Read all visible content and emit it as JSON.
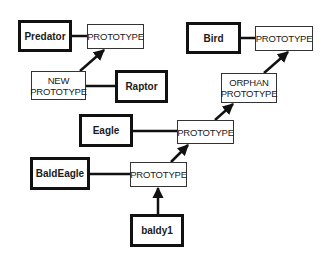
{
  "diagram": {
    "objects": [
      {
        "id": "predator",
        "label": "Predator",
        "x": 18,
        "y": 20,
        "w": 54,
        "h": 32
      },
      {
        "id": "raptor",
        "label": "Raptor",
        "x": 115,
        "y": 70,
        "w": 53,
        "h": 33
      },
      {
        "id": "bird",
        "label": "Bird",
        "x": 186,
        "y": 22,
        "w": 55,
        "h": 32
      },
      {
        "id": "eagle",
        "label": "Eagle",
        "x": 79,
        "y": 114,
        "w": 54,
        "h": 33
      },
      {
        "id": "baldeagle",
        "label": "BaldEagle",
        "x": 30,
        "y": 157,
        "w": 60,
        "h": 33
      },
      {
        "id": "baldy1",
        "label": "baldy1",
        "x": 130,
        "y": 214,
        "w": 54,
        "h": 33
      }
    ],
    "prototypes": [
      {
        "id": "predator_proto",
        "label": "PROTOTYPE",
        "x": 87,
        "y": 24,
        "w": 57,
        "h": 25
      },
      {
        "id": "new_proto",
        "label": "NEW PROTOTYPE",
        "line1": "NEW",
        "line2": "PROTOTYPE",
        "x": 31,
        "y": 71,
        "w": 55,
        "h": 29
      },
      {
        "id": "bird_proto",
        "label": "PROTOTYPE",
        "x": 255,
        "y": 26,
        "w": 58,
        "h": 25
      },
      {
        "id": "orphan_proto",
        "label": "ORPHAN PROTOTYPE",
        "line1": "ORPHAN",
        "line2": "PROTOTYPE",
        "x": 221,
        "y": 73,
        "w": 56,
        "h": 30
      },
      {
        "id": "eagle_proto",
        "label": "PROTOTYPE",
        "x": 177,
        "y": 120,
        "w": 57,
        "h": 24
      },
      {
        "id": "baldeagle_proto",
        "label": "PROTOTYPE",
        "x": 130,
        "y": 162,
        "w": 57,
        "h": 25
      }
    ],
    "links": [
      {
        "from": "Predator",
        "to": "PROTOTYPE",
        "type": "line",
        "x1": 72,
        "y1": 36,
        "x2": 87,
        "y2": 36
      },
      {
        "from": "Raptor",
        "to": "NEW PROTOTYPE",
        "type": "line",
        "x1": 86,
        "y1": 86,
        "x2": 115,
        "y2": 86
      },
      {
        "from": "Bird",
        "to": "PROTOTYPE",
        "type": "line",
        "x1": 241,
        "y1": 38,
        "x2": 255,
        "y2": 38
      },
      {
        "from": "Eagle",
        "to": "PROTOTYPE",
        "type": "line",
        "x1": 133,
        "y1": 131,
        "x2": 177,
        "y2": 131
      },
      {
        "from": "BaldEagle",
        "to": "PROTOTYPE",
        "type": "line",
        "x1": 90,
        "y1": 174,
        "x2": 130,
        "y2": 174
      }
    ],
    "arrows": [
      {
        "from": "NEW PROTOTYPE",
        "to": "Predator PROTOTYPE",
        "x1": 80,
        "y1": 71,
        "x2": 104,
        "y2": 50
      },
      {
        "from": "ORPHAN PROTOTYPE",
        "to": "Bird PROTOTYPE",
        "x1": 264,
        "y1": 73,
        "x2": 288,
        "y2": 52
      },
      {
        "from": "Eagle PROTOTYPE",
        "to": "ORPHAN PROTOTYPE",
        "x1": 215,
        "y1": 120,
        "x2": 233,
        "y2": 104
      },
      {
        "from": "BaldEagle PROTOTYPE",
        "to": "Eagle PROTOTYPE",
        "x1": 171,
        "y1": 162,
        "x2": 188,
        "y2": 145
      },
      {
        "from": "baldy1",
        "to": "BaldEagle PROTOTYPE",
        "x1": 158,
        "y1": 214,
        "x2": 158,
        "y2": 188
      }
    ],
    "colors": {
      "ink": "#111111",
      "background": "#ffffff"
    }
  }
}
